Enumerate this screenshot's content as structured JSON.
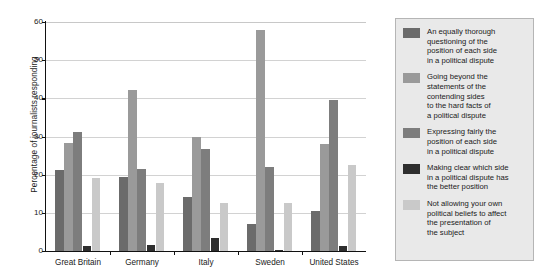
{
  "chart_data": {
    "type": "bar",
    "title": "",
    "xlabel": "",
    "ylabel": "Percentage of journalists responding",
    "ylim": [
      0,
      60
    ],
    "yticks": [
      0,
      10,
      20,
      30,
      40,
      50,
      60
    ],
    "ytick_labels": [
      "0",
      "10",
      "20",
      "30",
      "40",
      "50",
      "60"
    ],
    "grid": true,
    "legend_position": "right",
    "categories": [
      "Great Britain",
      "Germany",
      "Italy",
      "Sweden",
      "United States"
    ],
    "series": [
      {
        "name": "An equally thorough\nquestioning of the\nposition of each side\nin a political dispute",
        "color": "#6b6b6b",
        "values": [
          21.3,
          19.5,
          14.2,
          7.0,
          10.5
        ]
      },
      {
        "name": "Going beyond the\nstatements of the\ncontending sides\nto the hard facts of\na political dispute",
        "color": "#9a9a9a",
        "values": [
          28.4,
          42.3,
          30.0,
          58.0,
          28.0
        ]
      },
      {
        "name": "Expressing fairly the\nposition of each side\nin a political dispute",
        "color": "#7d7d7d",
        "values": [
          31.2,
          21.5,
          26.8,
          22.0,
          39.5
        ]
      },
      {
        "name": "Making clear which side\nin a political dispute has\nthe better position",
        "color": "#2e2e2e",
        "values": [
          1.3,
          1.6,
          3.5,
          0.3,
          1.3
        ]
      },
      {
        "name": "Not allowing your own\npolitical beliefs to affect\nthe presentation of\nthe subject",
        "color": "#c9c9c9",
        "values": [
          19.0,
          17.8,
          12.6,
          12.5,
          22.5
        ]
      }
    ]
  }
}
